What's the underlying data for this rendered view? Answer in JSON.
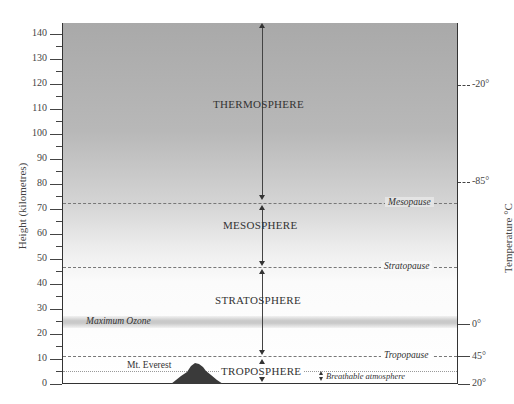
{
  "diagram": {
    "y_axis": {
      "label": "Height (kilometres)",
      "ticks": [
        "0",
        "10",
        "20",
        "30",
        "40",
        "50",
        "60",
        "70",
        "80",
        "90",
        "100",
        "110",
        "120",
        "130",
        "140"
      ]
    },
    "right_axis": {
      "label": "Temperature °C",
      "ticks": [
        {
          "label": "-20°",
          "height_km": 120
        },
        {
          "label": "-85°",
          "height_km": 81
        },
        {
          "label": "0°",
          "height_km": 24
        },
        {
          "label": "45°",
          "height_km": 11
        },
        {
          "label": "20°",
          "height_km": 0
        }
      ]
    },
    "layers": [
      {
        "name": "THERMOSPHERE",
        "from_km": 81,
        "to_km": 140
      },
      {
        "name": "MESOSPHERE",
        "from_km": 47,
        "to_km": 81
      },
      {
        "name": "STRATOSPHERE",
        "from_km": 11,
        "to_km": 47
      },
      {
        "name": "TROPOSPHERE",
        "from_km": 0,
        "to_km": 11
      }
    ],
    "boundaries": [
      {
        "name": "Mesopause",
        "height_km": 81
      },
      {
        "name": "Stratopause",
        "height_km": 47
      },
      {
        "name": "Tropopause",
        "height_km": 11
      }
    ],
    "annotations": {
      "ozone": "Maximum Ozone",
      "ozone_height_km": 25,
      "everest": "Mt. Everest",
      "everest_height_km": 8.8,
      "breathable": "Breathable atmosphere",
      "breathable_height_km": 5
    }
  }
}
